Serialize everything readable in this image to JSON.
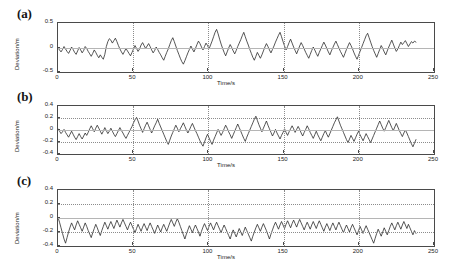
{
  "figure": {
    "background": "#ffffff",
    "trace_color": "#2b2b2b",
    "axis_color": "#4a4a4a",
    "grid_color": "#8c8c8c"
  },
  "panels": [
    {
      "label": "(a)",
      "name": "panel-a",
      "xlabel": "Time/s",
      "ylabel": "Deviation/m",
      "xticks": [
        "0",
        "50",
        "100",
        "150",
        "200",
        "250"
      ],
      "yticks": [
        "0.5",
        "0",
        "-0.5"
      ]
    },
    {
      "label": "(b)",
      "name": "panel-b",
      "xlabel": "Time/s",
      "ylabel": "Deviation/m",
      "xticks": [
        "0",
        "50",
        "100",
        "150",
        "200",
        "250"
      ],
      "yticks": [
        "0.4",
        "0.2",
        "0",
        "-0.2",
        "-0.4"
      ]
    },
    {
      "label": "(c)",
      "name": "panel-c",
      "xlabel": "Time/s",
      "ylabel": "Deviation/m",
      "xticks": [
        "0",
        "50",
        "100",
        "150",
        "200",
        "250"
      ],
      "yticks": [
        "0.4",
        "0.2",
        "0",
        "-0.2",
        "-0.4"
      ]
    }
  ],
  "chart_data": [
    {
      "type": "line",
      "panel": "(a)",
      "title": "",
      "xlabel": "Time/s",
      "ylabel": "Deviation/m",
      "xlim": [
        0,
        250
      ],
      "ylim": [
        -0.5,
        0.5
      ],
      "xticks": [
        0,
        50,
        100,
        150,
        200,
        250
      ],
      "yticks": [
        -0.5,
        0,
        0.5
      ],
      "grid": true,
      "legend": "none",
      "x_step": 1,
      "x_start": 0,
      "x_end": 238,
      "values": [
        -0.01,
        -0.05,
        -0.09,
        -0.04,
        0.02,
        -0.03,
        -0.08,
        -0.12,
        -0.06,
        0.01,
        -0.04,
        -0.1,
        -0.14,
        -0.07,
        0.0,
        -0.05,
        -0.11,
        -0.06,
        0.02,
        -0.02,
        -0.08,
        -0.13,
        -0.18,
        -0.12,
        -0.05,
        -0.1,
        -0.16,
        -0.21,
        -0.15,
        -0.2,
        -0.24,
        -0.14,
        0.02,
        0.12,
        0.18,
        0.15,
        0.09,
        0.14,
        0.19,
        0.12,
        0.04,
        -0.03,
        -0.09,
        -0.14,
        -0.08,
        -0.02,
        -0.07,
        -0.12,
        -0.17,
        -0.1,
        -0.03,
        0.04,
        -0.02,
        -0.08,
        -0.03,
        0.05,
        0.1,
        0.04,
        -0.02,
        0.03,
        0.08,
        0.02,
        -0.05,
        -0.11,
        -0.06,
        0.01,
        -0.04,
        -0.1,
        -0.15,
        -0.21,
        -0.26,
        -0.18,
        -0.1,
        -0.03,
        0.06,
        0.14,
        0.2,
        0.12,
        0.03,
        -0.06,
        -0.14,
        -0.22,
        -0.29,
        -0.34,
        -0.27,
        -0.19,
        -0.11,
        -0.04,
        0.03,
        -0.03,
        -0.09,
        -0.02,
        0.06,
        0.13,
        0.08,
        0.01,
        -0.05,
        0.02,
        0.09,
        0.04,
        -0.03,
        0.05,
        0.13,
        0.22,
        0.31,
        0.37,
        0.28,
        0.17,
        0.07,
        -0.02,
        -0.1,
        -0.17,
        -0.09,
        -0.01,
        0.06,
        0.0,
        -0.07,
        -0.13,
        -0.06,
        0.02,
        0.09,
        0.16,
        0.24,
        0.31,
        0.22,
        0.13,
        0.05,
        -0.04,
        -0.12,
        -0.2,
        -0.26,
        -0.18,
        -0.1,
        -0.16,
        -0.22,
        -0.15,
        -0.07,
        0.01,
        0.08,
        0.02,
        -0.05,
        -0.11,
        -0.04,
        0.03,
        0.11,
        0.18,
        0.25,
        0.31,
        0.22,
        0.12,
        0.03,
        -0.05,
        0.02,
        0.1,
        0.17,
        0.09,
        0.01,
        -0.06,
        -0.13,
        -0.05,
        0.03,
        0.1,
        0.04,
        -0.03,
        -0.1,
        -0.16,
        -0.22,
        -0.14,
        -0.06,
        0.01,
        -0.05,
        -0.12,
        -0.18,
        -0.1,
        -0.03,
        0.04,
        0.11,
        0.05,
        -0.02,
        -0.09,
        -0.15,
        -0.07,
        0.0,
        0.07,
        0.13,
        0.06,
        -0.01,
        -0.08,
        -0.14,
        -0.2,
        -0.12,
        -0.04,
        0.03,
        0.1,
        0.04,
        -0.03,
        -0.11,
        -0.18,
        -0.24,
        -0.16,
        -0.08,
        0.0,
        0.08,
        0.16,
        0.24,
        0.29,
        0.2,
        0.11,
        0.02,
        -0.06,
        -0.13,
        -0.2,
        -0.12,
        -0.04,
        0.04,
        -0.02,
        -0.09,
        -0.15,
        -0.07,
        0.01,
        0.08,
        0.15,
        0.07,
        -0.01,
        -0.08,
        -0.03,
        0.04,
        0.11,
        0.06,
        0.1,
        0.14,
        0.08,
        0.02,
        0.07,
        0.12,
        0.09,
        0.13,
        0.11
      ]
    },
    {
      "type": "line",
      "panel": "(b)",
      "title": "",
      "xlabel": "Time/s",
      "ylabel": "Deviation/m",
      "xlim": [
        0,
        250
      ],
      "ylim": [
        -0.4,
        0.4
      ],
      "xticks": [
        0,
        50,
        100,
        150,
        200,
        250
      ],
      "yticks": [
        -0.4,
        -0.2,
        0,
        0.2,
        0.4
      ],
      "grid": true,
      "legend": "none",
      "x_step": 1,
      "x_start": 0,
      "x_end": 238,
      "values": [
        0.02,
        -0.02,
        -0.06,
        -0.03,
        0.01,
        -0.04,
        -0.08,
        -0.12,
        -0.07,
        -0.02,
        -0.07,
        -0.12,
        -0.16,
        -0.11,
        -0.06,
        -0.11,
        -0.15,
        -0.1,
        -0.05,
        -0.09,
        -0.04,
        0.02,
        0.07,
        0.02,
        -0.03,
        0.03,
        0.08,
        0.03,
        -0.02,
        -0.07,
        -0.02,
        0.04,
        -0.01,
        -0.06,
        -0.02,
        0.03,
        -0.02,
        -0.07,
        -0.11,
        -0.06,
        -0.01,
        0.04,
        -0.01,
        -0.05,
        -0.1,
        -0.14,
        -0.09,
        -0.04,
        0.01,
        0.06,
        0.12,
        0.17,
        0.21,
        0.15,
        0.08,
        0.02,
        -0.04,
        0.02,
        0.08,
        0.13,
        0.07,
        0.01,
        -0.05,
        0.01,
        0.07,
        0.12,
        0.18,
        0.11,
        0.05,
        -0.01,
        -0.07,
        -0.13,
        -0.19,
        -0.24,
        -0.17,
        -0.1,
        -0.04,
        0.02,
        0.08,
        0.03,
        -0.03,
        0.02,
        0.07,
        0.12,
        0.06,
        0.0,
        -0.05,
        0.0,
        0.06,
        0.11,
        0.05,
        -0.01,
        -0.06,
        -0.12,
        -0.18,
        -0.23,
        -0.27,
        -0.2,
        -0.13,
        -0.07,
        -0.13,
        -0.19,
        -0.24,
        -0.17,
        -0.11,
        -0.05,
        0.01,
        -0.04,
        -0.09,
        -0.04,
        0.02,
        0.08,
        0.03,
        -0.03,
        -0.08,
        -0.14,
        -0.08,
        -0.02,
        0.04,
        0.1,
        0.04,
        -0.02,
        -0.08,
        -0.14,
        -0.19,
        -0.12,
        -0.06,
        0.0,
        0.06,
        0.12,
        0.18,
        0.23,
        0.16,
        0.09,
        0.03,
        -0.03,
        0.03,
        0.09,
        0.15,
        0.08,
        0.02,
        -0.04,
        -0.1,
        -0.05,
        0.01,
        -0.05,
        -0.1,
        -0.15,
        -0.09,
        -0.04,
        0.02,
        -0.04,
        -0.09,
        -0.03,
        0.02,
        0.07,
        0.02,
        -0.04,
        0.01,
        0.06,
        0.01,
        -0.05,
        -0.1,
        -0.04,
        0.01,
        0.07,
        0.02,
        -0.04,
        -0.09,
        -0.14,
        -0.08,
        -0.02,
        -0.08,
        -0.13,
        -0.18,
        -0.12,
        -0.06,
        -0.01,
        -0.07,
        -0.12,
        -0.06,
        0.0,
        0.06,
        0.12,
        0.17,
        0.22,
        0.15,
        0.08,
        0.02,
        -0.04,
        -0.1,
        -0.16,
        -0.21,
        -0.15,
        -0.09,
        -0.14,
        -0.19,
        -0.13,
        -0.07,
        -0.02,
        -0.08,
        -0.13,
        -0.18,
        -0.12,
        -0.06,
        -0.11,
        -0.16,
        -0.21,
        -0.15,
        -0.09,
        -0.03,
        0.03,
        0.09,
        0.15,
        0.09,
        0.03,
        -0.02,
        0.04,
        0.1,
        0.16,
        0.1,
        0.04,
        -0.01,
        0.05,
        0.11,
        0.05,
        -0.01,
        -0.06,
        -0.11,
        -0.05,
        0.0,
        -0.05,
        -0.11,
        -0.17,
        -0.23,
        -0.28,
        -0.22,
        -0.16
      ]
    },
    {
      "type": "line",
      "panel": "(c)",
      "title": "",
      "xlabel": "Time/s",
      "ylabel": "Deviation/m",
      "xlim": [
        0,
        250
      ],
      "ylim": [
        -0.4,
        0.4
      ],
      "xticks": [
        0,
        50,
        100,
        150,
        200,
        250
      ],
      "yticks": [
        -0.4,
        -0.2,
        0,
        0.2,
        0.4
      ],
      "grid": true,
      "legend": "none",
      "x_step": 1,
      "x_start": 0,
      "x_end": 238,
      "values": [
        0.01,
        -0.06,
        -0.14,
        -0.22,
        -0.3,
        -0.36,
        -0.28,
        -0.2,
        -0.13,
        -0.07,
        -0.12,
        -0.17,
        -0.1,
        -0.04,
        -0.09,
        -0.14,
        -0.19,
        -0.13,
        -0.07,
        -0.12,
        -0.18,
        -0.23,
        -0.28,
        -0.21,
        -0.15,
        -0.09,
        -0.14,
        -0.2,
        -0.25,
        -0.18,
        -0.12,
        -0.06,
        -0.11,
        -0.16,
        -0.1,
        -0.05,
        -0.1,
        -0.15,
        -0.09,
        -0.03,
        -0.08,
        -0.13,
        -0.07,
        -0.02,
        -0.07,
        -0.12,
        -0.17,
        -0.11,
        -0.06,
        -0.11,
        -0.16,
        -0.21,
        -0.15,
        -0.09,
        -0.14,
        -0.19,
        -0.13,
        -0.08,
        -0.13,
        -0.18,
        -0.12,
        -0.07,
        -0.12,
        -0.17,
        -0.22,
        -0.16,
        -0.1,
        -0.15,
        -0.2,
        -0.14,
        -0.09,
        -0.14,
        -0.19,
        -0.13,
        -0.07,
        -0.02,
        -0.07,
        -0.12,
        -0.06,
        -0.01,
        -0.06,
        -0.12,
        -0.18,
        -0.24,
        -0.3,
        -0.23,
        -0.17,
        -0.11,
        -0.16,
        -0.21,
        -0.15,
        -0.1,
        -0.15,
        -0.2,
        -0.26,
        -0.19,
        -0.13,
        -0.08,
        -0.13,
        -0.18,
        -0.12,
        -0.07,
        -0.12,
        -0.17,
        -0.11,
        -0.06,
        -0.11,
        -0.16,
        -0.21,
        -0.15,
        -0.1,
        -0.15,
        -0.2,
        -0.25,
        -0.3,
        -0.23,
        -0.17,
        -0.22,
        -0.27,
        -0.21,
        -0.15,
        -0.2,
        -0.25,
        -0.19,
        -0.13,
        -0.18,
        -0.23,
        -0.28,
        -0.33,
        -0.26,
        -0.2,
        -0.14,
        -0.09,
        -0.14,
        -0.19,
        -0.13,
        -0.08,
        -0.13,
        -0.18,
        -0.24,
        -0.3,
        -0.23,
        -0.17,
        -0.11,
        -0.06,
        -0.11,
        -0.16,
        -0.1,
        -0.05,
        -0.1,
        -0.15,
        -0.09,
        -0.04,
        -0.09,
        -0.14,
        -0.08,
        -0.03,
        -0.08,
        -0.13,
        -0.07,
        -0.02,
        -0.07,
        -0.12,
        -0.17,
        -0.11,
        -0.06,
        -0.11,
        -0.16,
        -0.1,
        -0.05,
        -0.1,
        -0.15,
        -0.09,
        -0.04,
        -0.09,
        -0.14,
        -0.19,
        -0.13,
        -0.08,
        -0.13,
        -0.18,
        -0.12,
        -0.07,
        -0.12,
        -0.17,
        -0.11,
        -0.06,
        -0.11,
        -0.16,
        -0.21,
        -0.15,
        -0.1,
        -0.15,
        -0.2,
        -0.14,
        -0.09,
        -0.14,
        -0.19,
        -0.24,
        -0.18,
        -0.12,
        -0.17,
        -0.22,
        -0.16,
        -0.11,
        -0.16,
        -0.21,
        -0.26,
        -0.31,
        -0.36,
        -0.29,
        -0.22,
        -0.16,
        -0.21,
        -0.26,
        -0.2,
        -0.14,
        -0.19,
        -0.24,
        -0.18,
        -0.12,
        -0.07,
        -0.12,
        -0.17,
        -0.11,
        -0.06,
        -0.11,
        -0.16,
        -0.1,
        -0.05,
        -0.1,
        -0.15,
        -0.09,
        -0.14,
        -0.19,
        -0.24,
        -0.18,
        -0.22
      ]
    }
  ]
}
